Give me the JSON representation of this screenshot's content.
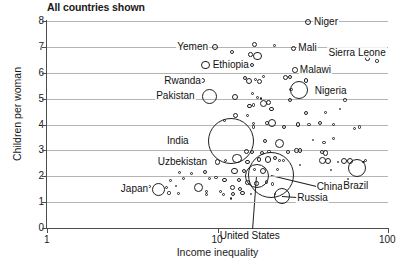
{
  "chart_data": {
    "type": "scatter",
    "title": "All countries shown",
    "xlabel": "Income inequality",
    "ylabel": "Children per woman",
    "xscale": "log",
    "xlim": [
      1,
      100
    ],
    "ylim": [
      0,
      8
    ],
    "xticks": [
      "1",
      "10",
      "100"
    ],
    "yticks": [
      "0",
      "1",
      "2",
      "3",
      "4",
      "5",
      "6",
      "7",
      "8"
    ],
    "grid": "horizontal",
    "legend": "none",
    "note": "Bubble area encodes population; outlines only, no fill.",
    "labeled_points": [
      {
        "name": "Niger",
        "x": 34.0,
        "y": 7.95,
        "r": 3.0,
        "label_dx": 6,
        "label_dy": -6
      },
      {
        "name": "Yemen",
        "x": 9.7,
        "y": 7.0,
        "r": 3.0,
        "label_dx": -40,
        "label_dy": -6
      },
      {
        "name": "Mali",
        "x": 28.0,
        "y": 6.95,
        "r": 2.6,
        "label_dx": 5,
        "label_dy": -6
      },
      {
        "name": "Sierra Leone",
        "x": 76.0,
        "y": 6.55,
        "r": 2.2,
        "label_dx": -42,
        "label_dy": -12
      },
      {
        "name": "Malawi",
        "x": 28.5,
        "y": 6.1,
        "r": 2.8,
        "label_dx": 5,
        "label_dy": -6
      },
      {
        "name": "Ethiopia",
        "x": 8.5,
        "y": 6.3,
        "r": 4.2,
        "label_dx": 6,
        "label_dy": -6
      },
      {
        "name": "Rwanda",
        "x": 8.2,
        "y": 5.7,
        "r": 2.6,
        "label_dx": -41,
        "label_dy": -6
      },
      {
        "name": "Nigeria",
        "x": 30.0,
        "y": 5.35,
        "r": 9.0,
        "label_dx": 10,
        "label_dy": -5
      },
      {
        "name": "Pakistan",
        "x": 9.0,
        "y": 5.1,
        "r": 7.5,
        "label_dx": -51,
        "label_dy": -6
      },
      {
        "name": "India",
        "x": 12.0,
        "y": 3.35,
        "r": 23.0,
        "label_dx": -46,
        "label_dy": -6
      },
      {
        "name": "Uzbekistan",
        "x": 10.0,
        "y": 2.55,
        "r": 2.8,
        "label_dx": -62,
        "label_dy": -6
      },
      {
        "name": "China",
        "x": 20.5,
        "y": 2.05,
        "r": 23.0,
        "label_dx": 26,
        "label_dy": 6
      },
      {
        "name": "Brazil",
        "x": 66.0,
        "y": 2.3,
        "r": 9.0,
        "label_dx": -10,
        "label_dy": 12
      },
      {
        "name": "Japan",
        "x": 4.5,
        "y": 1.5,
        "r": 6.5,
        "label_dx": -36,
        "label_dy": -6
      },
      {
        "name": "Russia",
        "x": 24.0,
        "y": 1.25,
        "r": 8.0,
        "label_dx": 10,
        "label_dy": -4
      },
      {
        "name": "United States",
        "x": 17.0,
        "y": 2.0,
        "r": 12.0,
        "label_dx": -30,
        "label_dy": 54
      }
    ],
    "unlabeled_points": [
      {
        "x": 12.2,
        "y": 6.8,
        "r": 1.9
      },
      {
        "x": 16.5,
        "y": 7.1,
        "r": 2.7
      },
      {
        "x": 15.6,
        "y": 6.7,
        "r": 2.3
      },
      {
        "x": 17.1,
        "y": 6.65,
        "r": 4.4
      },
      {
        "x": 21.5,
        "y": 7.05,
        "r": 1.4
      },
      {
        "x": 16.0,
        "y": 6.3,
        "r": 2.0
      },
      {
        "x": 86.0,
        "y": 6.45,
        "r": 1.7
      },
      {
        "x": 14.5,
        "y": 5.8,
        "r": 2.1
      },
      {
        "x": 15.2,
        "y": 5.7,
        "r": 3.0
      },
      {
        "x": 16.7,
        "y": 5.75,
        "r": 1.6
      },
      {
        "x": 17.6,
        "y": 5.65,
        "r": 2.6
      },
      {
        "x": 18.6,
        "y": 5.85,
        "r": 1.6
      },
      {
        "x": 25.2,
        "y": 5.8,
        "r": 2.5
      },
      {
        "x": 26.6,
        "y": 5.85,
        "r": 2.0
      },
      {
        "x": 33.0,
        "y": 5.7,
        "r": 2.3
      },
      {
        "x": 27.0,
        "y": 5.35,
        "r": 1.6
      },
      {
        "x": 12.6,
        "y": 5.05,
        "r": 3.0
      },
      {
        "x": 16.0,
        "y": 5.2,
        "r": 1.8
      },
      {
        "x": 17.2,
        "y": 5.05,
        "r": 1.5
      },
      {
        "x": 18.0,
        "y": 5.0,
        "r": 1.4
      },
      {
        "x": 16.2,
        "y": 4.75,
        "r": 1.7
      },
      {
        "x": 15.4,
        "y": 4.7,
        "r": 2.1
      },
      {
        "x": 18.5,
        "y": 4.8,
        "r": 3.5
      },
      {
        "x": 19.8,
        "y": 4.85,
        "r": 2.5
      },
      {
        "x": 20.8,
        "y": 4.6,
        "r": 2.4
      },
      {
        "x": 26.5,
        "y": 4.95,
        "r": 2.1
      },
      {
        "x": 56.0,
        "y": 4.95,
        "r": 1.6
      },
      {
        "x": 11.0,
        "y": 4.15,
        "r": 1.8
      },
      {
        "x": 12.8,
        "y": 4.35,
        "r": 2.5
      },
      {
        "x": 15.0,
        "y": 4.35,
        "r": 1.9
      },
      {
        "x": 33.0,
        "y": 4.45,
        "r": 2.3
      },
      {
        "x": 43.0,
        "y": 4.45,
        "r": 1.4
      },
      {
        "x": 16.2,
        "y": 4.05,
        "r": 1.6
      },
      {
        "x": 16.3,
        "y": 3.9,
        "r": 1.6
      },
      {
        "x": 19.5,
        "y": 4.05,
        "r": 1.8
      },
      {
        "x": 21.0,
        "y": 4.05,
        "r": 4.0
      },
      {
        "x": 24.5,
        "y": 3.9,
        "r": 2.2
      },
      {
        "x": 29.5,
        "y": 4.0,
        "r": 2.1
      },
      {
        "x": 34.5,
        "y": 4.0,
        "r": 1.9
      },
      {
        "x": 40.0,
        "y": 4.05,
        "r": 2.0
      },
      {
        "x": 48.0,
        "y": 4.0,
        "r": 1.6
      },
      {
        "x": 64.0,
        "y": 3.85,
        "r": 1.5
      },
      {
        "x": 68.0,
        "y": 3.9,
        "r": 1.8
      },
      {
        "x": 19.0,
        "y": 3.35,
        "r": 2.1
      },
      {
        "x": 23.0,
        "y": 3.25,
        "r": 4.5
      },
      {
        "x": 42.0,
        "y": 3.3,
        "r": 1.8
      },
      {
        "x": 48.0,
        "y": 3.45,
        "r": 1.4
      },
      {
        "x": 14.8,
        "y": 2.95,
        "r": 2.5
      },
      {
        "x": 16.0,
        "y": 2.95,
        "r": 2.0
      },
      {
        "x": 18.2,
        "y": 2.9,
        "r": 2.2
      },
      {
        "x": 20.0,
        "y": 2.95,
        "r": 1.7
      },
      {
        "x": 26.0,
        "y": 2.95,
        "r": 1.9
      },
      {
        "x": 29.0,
        "y": 3.0,
        "r": 2.3
      },
      {
        "x": 30.5,
        "y": 3.0,
        "r": 2.2
      },
      {
        "x": 41.0,
        "y": 2.95,
        "r": 1.9
      },
      {
        "x": 43.0,
        "y": 2.9,
        "r": 2.6
      },
      {
        "x": 11.2,
        "y": 2.62,
        "r": 1.5
      },
      {
        "x": 13.0,
        "y": 2.7,
        "r": 4.6
      },
      {
        "x": 15.0,
        "y": 2.55,
        "r": 2.2
      },
      {
        "x": 17.5,
        "y": 2.65,
        "r": 2.4
      },
      {
        "x": 19.8,
        "y": 2.65,
        "r": 3.2
      },
      {
        "x": 21.8,
        "y": 2.7,
        "r": 2.0
      },
      {
        "x": 23.0,
        "y": 2.6,
        "r": 1.4
      },
      {
        "x": 24.5,
        "y": 2.6,
        "r": 1.4
      },
      {
        "x": 41.5,
        "y": 2.6,
        "r": 3.4
      },
      {
        "x": 44.5,
        "y": 2.6,
        "r": 3.2
      },
      {
        "x": 51.0,
        "y": 2.55,
        "r": 1.3
      },
      {
        "x": 55.0,
        "y": 2.6,
        "r": 3.1
      },
      {
        "x": 59.5,
        "y": 2.6,
        "r": 3.0
      },
      {
        "x": 6.0,
        "y": 2.15,
        "r": 1.5
      },
      {
        "x": 7.0,
        "y": 2.1,
        "r": 1.5
      },
      {
        "x": 8.4,
        "y": 2.15,
        "r": 2.0
      },
      {
        "x": 12.6,
        "y": 2.2,
        "r": 3.2
      },
      {
        "x": 14.3,
        "y": 2.2,
        "r": 2.1
      },
      {
        "x": 16.5,
        "y": 2.25,
        "r": 1.5
      },
      {
        "x": 18.6,
        "y": 2.2,
        "r": 3.0
      },
      {
        "x": 22.5,
        "y": 2.25,
        "r": 1.5
      },
      {
        "x": 5.3,
        "y": 1.85,
        "r": 1.4
      },
      {
        "x": 6.3,
        "y": 1.9,
        "r": 1.6
      },
      {
        "x": 9.0,
        "y": 1.9,
        "r": 1.6
      },
      {
        "x": 9.8,
        "y": 1.95,
        "r": 1.7
      },
      {
        "x": 11.0,
        "y": 1.85,
        "r": 2.3
      },
      {
        "x": 13.4,
        "y": 1.85,
        "r": 2.0
      },
      {
        "x": 15.0,
        "y": 1.75,
        "r": 2.3
      },
      {
        "x": 17.0,
        "y": 1.72,
        "r": 2.3
      },
      {
        "x": 19.4,
        "y": 1.78,
        "r": 1.6
      },
      {
        "x": 21.0,
        "y": 1.7,
        "r": 1.8
      },
      {
        "x": 4.0,
        "y": 1.6,
        "r": 1.4
      },
      {
        "x": 5.0,
        "y": 1.55,
        "r": 1.5
      },
      {
        "x": 5.7,
        "y": 1.62,
        "r": 1.3
      },
      {
        "x": 7.7,
        "y": 1.55,
        "r": 4.4
      },
      {
        "x": 12.2,
        "y": 1.55,
        "r": 2.4
      },
      {
        "x": 13.6,
        "y": 1.5,
        "r": 2.1
      },
      {
        "x": 8.6,
        "y": 1.42,
        "r": 1.6
      },
      {
        "x": 5.2,
        "y": 1.35,
        "r": 1.6
      },
      {
        "x": 5.9,
        "y": 1.32,
        "r": 1.4
      },
      {
        "x": 8.6,
        "y": 1.3,
        "r": 1.6
      },
      {
        "x": 10.4,
        "y": 1.4,
        "r": 1.5
      },
      {
        "x": 10.8,
        "y": 1.3,
        "r": 1.4
      },
      {
        "x": 12.4,
        "y": 1.33,
        "r": 2.0
      },
      {
        "x": 14.0,
        "y": 1.35,
        "r": 2.4
      },
      {
        "x": 15.6,
        "y": 1.3,
        "r": 0.9
      },
      {
        "x": 21.8,
        "y": 1.32,
        "r": 1.2
      },
      {
        "x": 12.0,
        "y": 1.15,
        "r": 1.4
      },
      {
        "x": 58.0,
        "y": 1.9,
        "r": 0.9
      },
      {
        "x": 57.0,
        "y": 1.55,
        "r": 0.9
      },
      {
        "x": 46.0,
        "y": 2.25,
        "r": 1.0
      },
      {
        "x": 30.5,
        "y": 2.45,
        "r": 1.1
      },
      {
        "x": 36.5,
        "y": 3.4,
        "r": 1.0
      },
      {
        "x": 52.0,
        "y": 4.6,
        "r": 0.9
      },
      {
        "x": 72.0,
        "y": 2.55,
        "r": 1.4
      },
      {
        "x": 74.0,
        "y": 2.6,
        "r": 1.6
      }
    ]
  },
  "axes": {
    "title": "All countries shown",
    "x_title": "Income inequality",
    "y_title": "Children per woman"
  }
}
